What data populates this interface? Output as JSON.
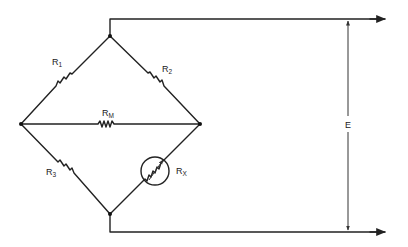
{
  "diagram": {
    "colors": {
      "line": "#222222",
      "background": "#ffffff"
    },
    "components": [
      {
        "id": "R1",
        "label": "R",
        "subscript": "1",
        "type": "resistor",
        "branch": "top-to-left"
      },
      {
        "id": "R2",
        "label": "R",
        "subscript": "2",
        "type": "resistor",
        "branch": "top-to-right"
      },
      {
        "id": "RM",
        "label": "R",
        "subscript": "M",
        "type": "resistor",
        "branch": "left-to-right (meter)"
      },
      {
        "id": "R3",
        "label": "R",
        "subscript": "3",
        "type": "resistor",
        "branch": "left-to-bottom"
      },
      {
        "id": "RX",
        "label": "R",
        "subscript": "X",
        "type": "variable-resistor-circled",
        "branch": "bottom-to-right"
      }
    ],
    "output": {
      "label": "E",
      "type": "voltage-dimension",
      "description": "output voltage across top and bottom terminals"
    },
    "nodes": [
      "top",
      "left",
      "right",
      "bottom"
    ]
  }
}
